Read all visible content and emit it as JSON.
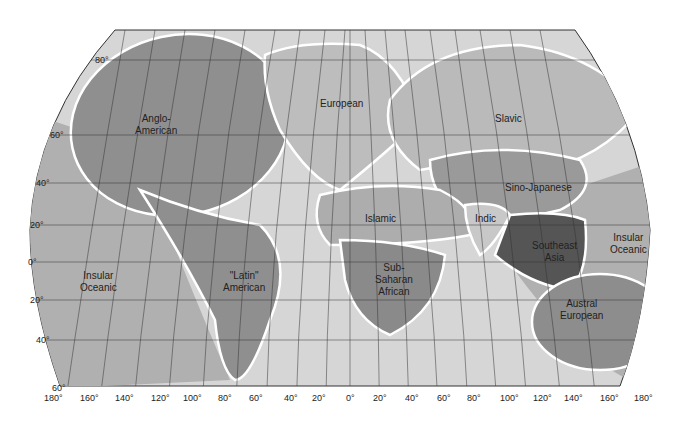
{
  "map": {
    "title": "World Culture Realms",
    "colors": {
      "ocean_light": "#d8d8d8",
      "ocean_mid": "#b4b4b4",
      "realm_dark": "#8e8e8e",
      "realm_medium": "#a6a6a6",
      "realm_darkest": "#555555",
      "boundary": "#ffffff",
      "grid": "#333333"
    },
    "regions": [
      {
        "id": "anglo-american",
        "label": "Anglo-\nAmerican"
      },
      {
        "id": "european",
        "label": "European"
      },
      {
        "id": "slavic",
        "label": "Slavic"
      },
      {
        "id": "sino-japanese",
        "label": "Sino-Japanese"
      },
      {
        "id": "islamic",
        "label": "Islamic"
      },
      {
        "id": "indic",
        "label": "Indic"
      },
      {
        "id": "southeast-asia",
        "label": "Southeast\nAsia"
      },
      {
        "id": "sub-saharan-african",
        "label": "Sub-\nSaharan\nAfrican"
      },
      {
        "id": "latin-american",
        "label": "\"Latin\"\nAmerican"
      },
      {
        "id": "insular-oceanic-west",
        "label": "Insular\nOceanic"
      },
      {
        "id": "insular-oceanic-east",
        "label": "Insular\nOceanic"
      },
      {
        "id": "austral-european",
        "label": "Austral\nEuropean"
      }
    ],
    "latitude_ticks": [
      "80°",
      "60°",
      "40°",
      "20°",
      "0°",
      "20°",
      "40°",
      "60°"
    ],
    "longitude_ticks": [
      "180°",
      "160°",
      "140°",
      "120°",
      "100°",
      "80°",
      "60°",
      "40°",
      "20°",
      "0°",
      "20°",
      "40°",
      "60°",
      "80°",
      "100°",
      "120°",
      "140°",
      "160°",
      "180°"
    ]
  }
}
